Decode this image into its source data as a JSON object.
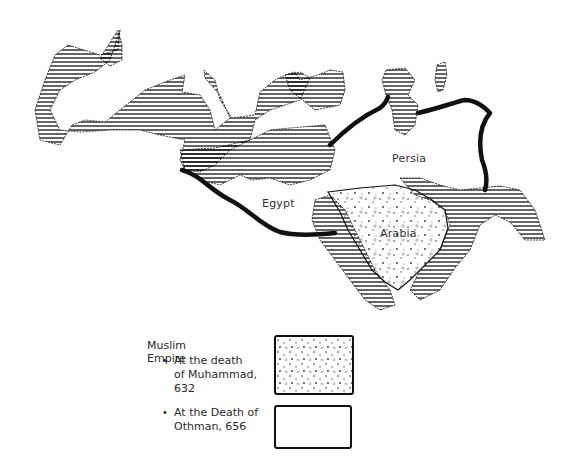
{
  "map": {
    "labels": {
      "persia": "Persia",
      "egypt": "Egypt",
      "arabia": "Arabia"
    },
    "colors": {
      "ink": "#111111",
      "background": "#ffffff"
    }
  },
  "legend": {
    "title": "Muslim Empire",
    "items": [
      {
        "bullet": "•",
        "line1": "At the death",
        "line2": "of Muhammad,",
        "line3": "632",
        "swatch": "stippled"
      },
      {
        "bullet": "•",
        "line1": "At the Death of",
        "line2": "Othman, 656",
        "swatch": "blank"
      }
    ]
  }
}
